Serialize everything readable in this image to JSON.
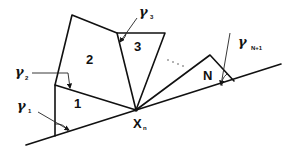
{
  "diagram": {
    "title": "",
    "blocks": [
      {
        "id": "block-1",
        "label": "1"
      },
      {
        "id": "block-2",
        "label": "2"
      },
      {
        "id": "block-3",
        "label": "3"
      },
      {
        "id": "block-N",
        "label": "N"
      }
    ],
    "point": {
      "label": "X",
      "subscript": "n"
    },
    "ellipsis": "· · ·",
    "angles": [
      {
        "symbol": "γ",
        "subscript": "1"
      },
      {
        "symbol": "γ",
        "subscript": "2"
      },
      {
        "symbol": "γ",
        "subscript": "3"
      },
      {
        "symbol": "γ",
        "subscript": "N+1"
      }
    ],
    "colors": {
      "stroke": "#111111",
      "background": "#ffffff"
    }
  }
}
